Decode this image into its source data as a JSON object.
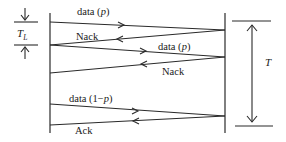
{
  "diagram": {
    "type": "stop-and-wait ARQ timing diagram",
    "stroke_color": "#2a2a2a",
    "messages": [
      {
        "direction": "sender-to-receiver",
        "label": "data (p)",
        "label_text": "data (",
        "label_var": "p",
        "label_close": ")"
      },
      {
        "direction": "receiver-to-sender",
        "label": "Nack"
      },
      {
        "direction": "sender-to-receiver",
        "label": "data (p)",
        "label_text": "data (",
        "label_var": "p",
        "label_close": ")"
      },
      {
        "direction": "receiver-to-sender",
        "label": "Nack"
      },
      {
        "direction": "sender-to-receiver",
        "label": "data (1−p)",
        "label_text": "data (1−",
        "label_var": "p",
        "label_close": ")"
      },
      {
        "direction": "receiver-to-sender",
        "label": "Ack"
      }
    ],
    "tl_marker": {
      "label_main": "T",
      "label_sub": "L"
    },
    "t_marker": {
      "label": "T"
    }
  }
}
